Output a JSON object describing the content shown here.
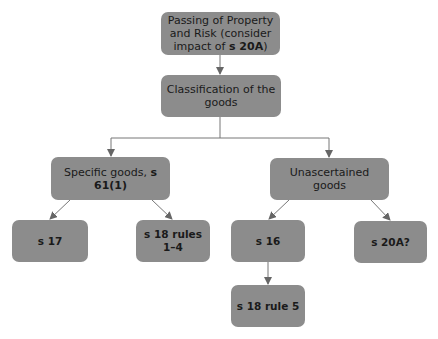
{
  "diagram": {
    "type": "flowchart",
    "nodes": {
      "root": {
        "text": "Passing of Property and Risk (consider impact of ",
        "bold": "s 20A",
        "after": ")"
      },
      "classification": {
        "text": "Classification of the goods"
      },
      "specific": {
        "text": "Specific goods, ",
        "bold": "s 61(1)"
      },
      "unascertained": {
        "text": "Unascertained goods"
      },
      "s17": {
        "text": "s 17"
      },
      "s18_rules_1_4": {
        "text": "s 18 rules 1–4"
      },
      "s16": {
        "text": "s 16"
      },
      "s20A": {
        "text": "s 20A?"
      },
      "s18_rule_5": {
        "text": "s 18 rule 5"
      }
    },
    "edges": [
      [
        "root",
        "classification"
      ],
      [
        "classification",
        "specific"
      ],
      [
        "classification",
        "unascertained"
      ],
      [
        "specific",
        "s17"
      ],
      [
        "specific",
        "s18_rules_1_4"
      ],
      [
        "unascertained",
        "s16"
      ],
      [
        "unascertained",
        "s20A"
      ],
      [
        "s16",
        "s18_rule_5"
      ]
    ],
    "colors": {
      "box": "#8c8c8c",
      "line": "#777777",
      "text": "#1a1a1a"
    }
  }
}
